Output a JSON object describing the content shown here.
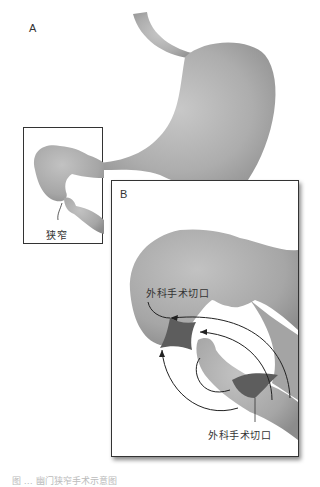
{
  "figure": {
    "panel_a_label": "A",
    "panel_b_label": "B",
    "stenosis_label": "狭窄",
    "incision_label_top": "外科手术切口",
    "incision_label_bottom": "外科手术切口",
    "caption": "图 … 幽门狭窄手术示意图"
  },
  "colors": {
    "organ_fill": "#a9a9a9",
    "organ_shadow": "#8a8a8a",
    "organ_highlight": "#c4c4c4",
    "incision_fill": "#5e5e5e",
    "box_border": "#333333",
    "arrow": "#222222"
  }
}
